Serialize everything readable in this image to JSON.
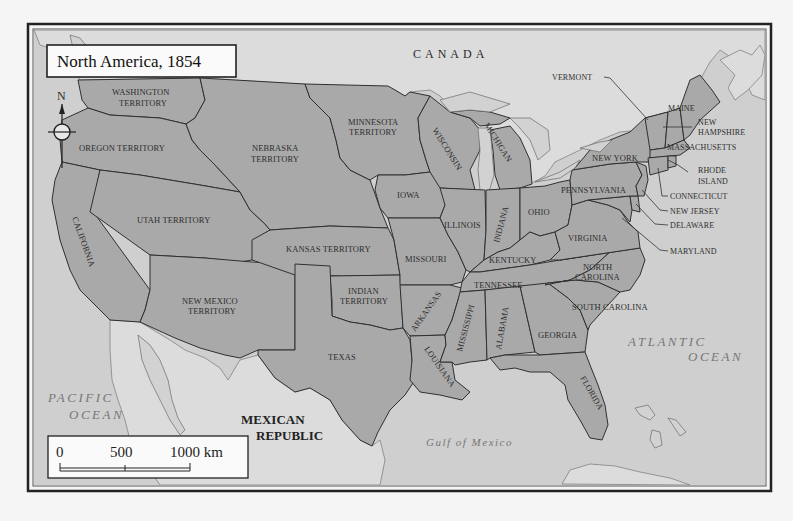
{
  "title": "North America, 1854",
  "compass": {
    "label": "N",
    "icon": "compass-rose-icon"
  },
  "countries": {
    "canada": "CANADA",
    "mexico_line1": "MEXICAN",
    "mexico_line2": "REPUBLIC"
  },
  "water": {
    "pacific_line1": "PACIFIC",
    "pacific_line2": "OCEAN",
    "atlantic_line1": "ATLANTIC",
    "atlantic_line2": "OCEAN",
    "gulf": "Gulf of Mexico"
  },
  "territories": {
    "washington_1": "WASHINGTON",
    "washington_2": "TERRITORY",
    "oregon": "OREGON TERRITORY",
    "nebraska_1": "NEBRASKA",
    "nebraska_2": "TERRITORY",
    "minnesota_1": "MINNESOTA",
    "minnesota_2": "TERRITORY",
    "utah": "UTAH TERRITORY",
    "kansas": "KANSAS TERRITORY",
    "new_mexico_1": "NEW MEXICO",
    "new_mexico_2": "TERRITORY",
    "indian_1": "INDIAN",
    "indian_2": "TERRITORY"
  },
  "states": {
    "california": "CALIFORNIA",
    "texas": "TEXAS",
    "iowa": "IOWA",
    "missouri": "MISSOURI",
    "arkansas": "ARKANSAS",
    "louisiana": "LOUISIANA",
    "wisconsin": "WISCONSIN",
    "michigan": "MICHIGAN",
    "illinois": "ILLINOIS",
    "indiana": "INDIANA",
    "ohio": "OHIO",
    "kentucky": "KENTUCKY",
    "tennessee": "TENNESSEE",
    "mississippi": "MISSISSIPPI",
    "alabama": "ALABAMA",
    "georgia": "GEORGIA",
    "florida": "FLORIDA",
    "south_carolina": "SOUTH CAROLINA",
    "north_carolina_1": "NORTH",
    "north_carolina_2": "CAROLINA",
    "virginia": "VIRGINIA",
    "pennsylvania": "PENNSYLVANIA",
    "new_york": "NEW YORK",
    "vermont": "VERMONT",
    "maine": "MAINE",
    "new_hampshire_1": "NEW",
    "new_hampshire_2": "HAMPSHIRE",
    "massachusetts": "MASSACHUSETTS",
    "rhode_island_1": "RHODE",
    "rhode_island_2": "ISLAND",
    "connecticut": "CONNECTICUT",
    "new_jersey": "NEW JERSEY",
    "delaware": "DELAWARE",
    "maryland": "MARYLAND"
  },
  "scale_bar": {
    "tick_0": "0",
    "tick_500": "500",
    "tick_1000": "1000 km"
  },
  "colors": {
    "us_land": "#a9a9a9",
    "foreign_land": "#f2f2f2",
    "water": "#cfcfcf",
    "border": "#303030"
  }
}
